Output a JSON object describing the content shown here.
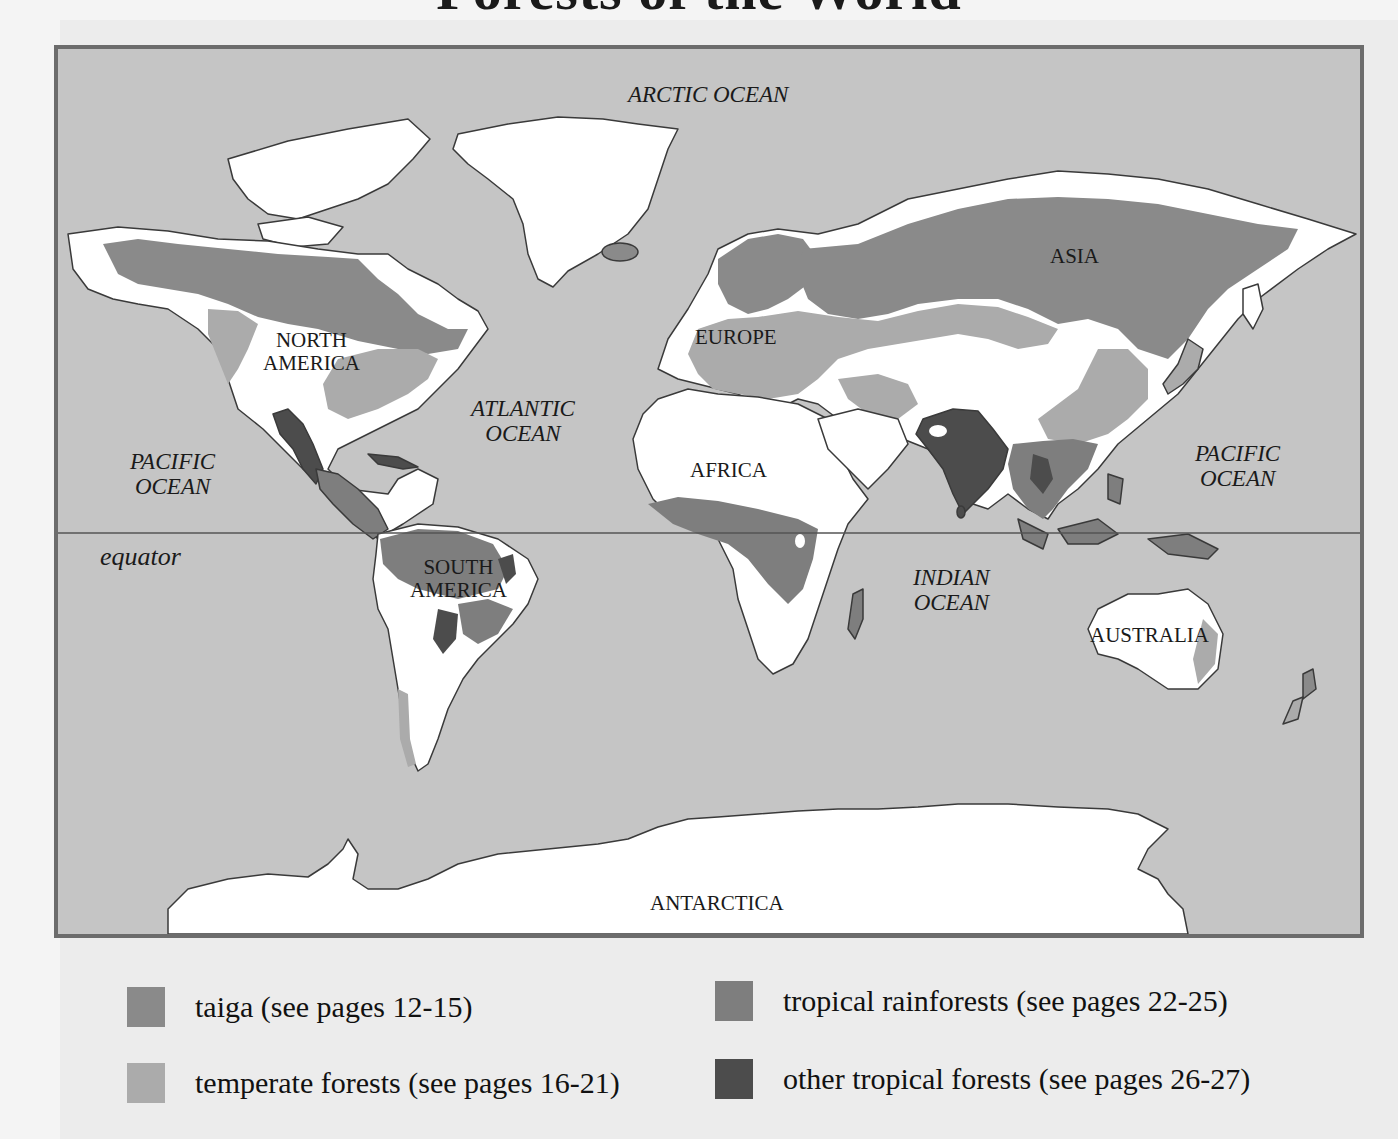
{
  "title": "Forests of the World",
  "map": {
    "colors": {
      "ocean": "#c5c5c5",
      "land": "#ffffff",
      "coastline": "#3a3a3a",
      "frame": "#6c6c6c",
      "taiga": "#8a8a8a",
      "temperate": "#ababab",
      "tropical_rainforest": "#7e7e7e",
      "other_tropical": "#4c4c4c"
    },
    "oceans": [
      {
        "id": "arctic",
        "lines": [
          "ARCTIC OCEAN"
        ]
      },
      {
        "id": "atlantic",
        "lines": [
          "ATLANTIC",
          "OCEAN"
        ]
      },
      {
        "id": "pacific-west",
        "lines": [
          "PACIFIC",
          "OCEAN"
        ]
      },
      {
        "id": "pacific-east",
        "lines": [
          "PACIFIC",
          "OCEAN"
        ]
      },
      {
        "id": "indian",
        "lines": [
          "INDIAN",
          "OCEAN"
        ]
      }
    ],
    "continents": [
      {
        "id": "north-america",
        "lines": [
          "NORTH",
          "AMERICA"
        ]
      },
      {
        "id": "south-america",
        "lines": [
          "SOUTH",
          "AMERICA"
        ]
      },
      {
        "id": "europe",
        "lines": [
          "EUROPE"
        ]
      },
      {
        "id": "asia",
        "lines": [
          "ASIA"
        ]
      },
      {
        "id": "africa",
        "lines": [
          "AFRICA"
        ]
      },
      {
        "id": "australia",
        "lines": [
          "AUSTRALIA"
        ]
      },
      {
        "id": "antarctica",
        "lines": [
          "ANTARCTICA"
        ]
      }
    ],
    "equator_label": "equator"
  },
  "legend": [
    {
      "label": "taiga (see pages 12-15)",
      "color": "#8a8a8a"
    },
    {
      "label": "temperate forests (see pages 16-21)",
      "color": "#ababab"
    },
    {
      "label": "tropical rainforests (see pages 22-25)",
      "color": "#7e7e7e"
    },
    {
      "label": "other tropical forests (see pages 26-27)",
      "color": "#4c4c4c"
    }
  ]
}
